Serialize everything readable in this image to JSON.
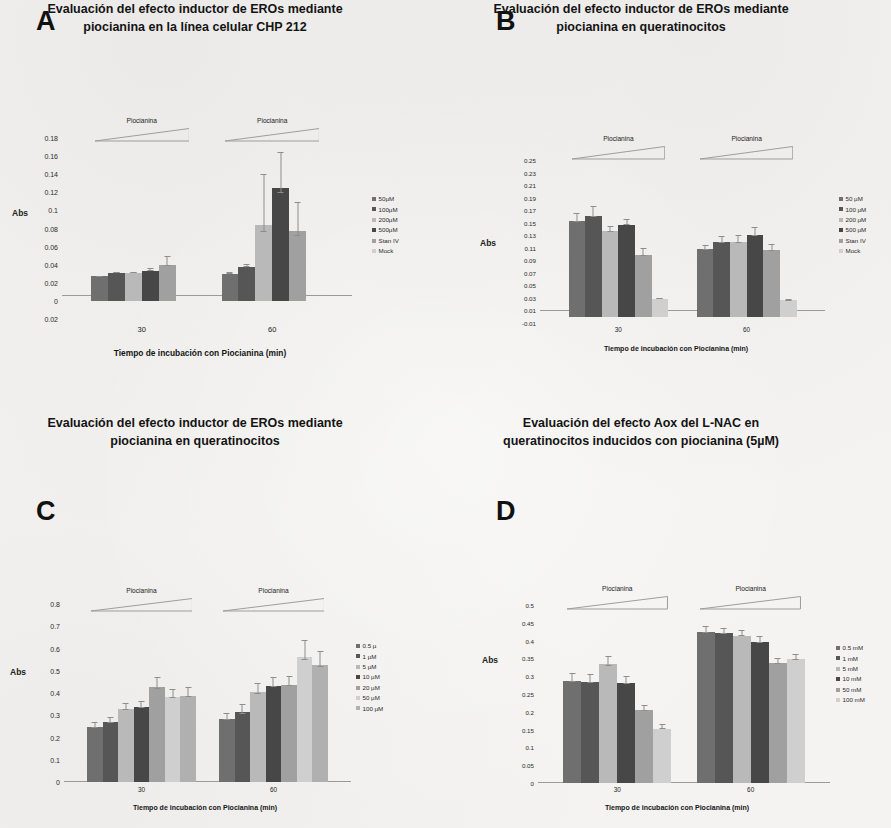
{
  "figure": {
    "panels": [
      "A",
      "B",
      "C",
      "D"
    ]
  },
  "palette": {
    "s1": "#6f6f6f",
    "s2": "#565656",
    "s3": "#b9b9b9",
    "s4": "#474747",
    "s5": "#a0a0a0",
    "s6": "#cfcfcf",
    "s7": "#b0b0b0",
    "axis": "#9a9a9a",
    "text": "#1b1b1b",
    "error_bar": "#8d8d8d"
  },
  "panelA": {
    "letter": "A",
    "title_line1": "Evaluación del efecto inductor de EROs mediante",
    "title_line2": "piocianina en la línea celular CHP 212",
    "wedge_label": "Piocianina",
    "chart_data": {
      "type": "bar",
      "title": "Evaluación del efecto inductor de EROs mediante piocianina en la línea celular CHP 212",
      "xlabel": "Tiempo de incubación con Piocianina (min)",
      "ylabel": "Abs",
      "categories": [
        "30",
        "60"
      ],
      "ylim": [
        -0.02,
        0.18
      ],
      "yticks": [
        "0.18",
        "0.16",
        "0.14",
        "0.12",
        "0.1",
        "0.08",
        "0.06",
        "0.04",
        "0.02",
        "0",
        "0.02"
      ],
      "ytick_values": [
        0.18,
        0.16,
        0.14,
        0.12,
        0.1,
        0.08,
        0.06,
        0.04,
        0.02,
        0,
        -0.02
      ],
      "grid": false,
      "legend_position": "right",
      "series": [
        {
          "name": "50µM",
          "values": [
            0.027,
            0.03
          ],
          "errors": [
            0.001,
            0.002
          ]
        },
        {
          "name": "100µM",
          "values": [
            0.031,
            0.038
          ],
          "errors": [
            0.001,
            0.003
          ]
        },
        {
          "name": "200µM",
          "values": [
            0.031,
            0.084
          ],
          "errors": [
            0.001,
            0.056
          ]
        },
        {
          "name": "500µM",
          "values": [
            0.033,
            0.125
          ],
          "errors": [
            0.003,
            0.04
          ]
        },
        {
          "name": "Stan IV",
          "values": [
            0.04,
            0.077
          ],
          "errors": [
            0.01,
            0.032
          ]
        },
        {
          "name": "Mock",
          "values": [
            0.0,
            0.0
          ],
          "errors": [
            0.0,
            0.0
          ]
        }
      ]
    }
  },
  "panelB": {
    "letter": "B",
    "title_line1": "Evaluación del efecto inductor de EROs mediante",
    "title_line2": "piocianina en queratinocitos",
    "wedge_label": "Piocianina",
    "chart_data": {
      "type": "bar",
      "title": "Evaluación del efecto inductor de EROs mediante piocianina en queratinocitos",
      "xlabel": "Tiempo de incubación con Piocianina (min)",
      "ylabel": "Abs",
      "categories": [
        "30",
        "60"
      ],
      "ylim": [
        -0.01,
        0.25
      ],
      "yticks": [
        "0.25",
        "0.23",
        "0.21",
        "0.19",
        "0.17",
        "0.15",
        "0.13",
        "0.11",
        "0.09",
        "0.07",
        "0.05",
        "0.03",
        "0.01",
        "-0.01"
      ],
      "ytick_values": [
        0.25,
        0.23,
        0.21,
        0.19,
        0.17,
        0.15,
        0.13,
        0.11,
        0.09,
        0.07,
        0.05,
        0.03,
        0.01,
        -0.01
      ],
      "grid": false,
      "legend_position": "right",
      "series": [
        {
          "name": "50 µM",
          "values": [
            0.153,
            0.108
          ],
          "errors": [
            0.013,
            0.006
          ]
        },
        {
          "name": "100 µM",
          "values": [
            0.161,
            0.119
          ],
          "errors": [
            0.016,
            0.01
          ]
        },
        {
          "name": "200 µM",
          "values": [
            0.136,
            0.119
          ],
          "errors": [
            0.008,
            0.011
          ]
        },
        {
          "name": "500 µM",
          "values": [
            0.147,
            0.131
          ],
          "errors": [
            0.009,
            0.012
          ]
        },
        {
          "name": "Stan IV",
          "values": [
            0.098,
            0.106
          ],
          "errors": [
            0.012,
            0.01
          ]
        },
        {
          "name": "Mock",
          "values": [
            0.028,
            0.026
          ],
          "errors": [
            0.002,
            0.002
          ]
        }
      ]
    }
  },
  "panelC": {
    "letter": "C",
    "title_line1": "Evaluación del efecto inductor de EROs mediante",
    "title_line2": "piocianina en queratinocitos",
    "wedge_label": "Piocianina",
    "chart_data": {
      "type": "bar",
      "title": "Evaluación del efecto inductor de EROs mediante piocianina en queratinocitos",
      "xlabel": "Tiempo de incubación  con Piocianina (min)",
      "ylabel": "Abs",
      "categories": [
        "30",
        "60"
      ],
      "ylim": [
        0,
        0.8
      ],
      "yticks": [
        "0.8",
        "0.7",
        "0.6",
        "0.5",
        "0.4",
        "0.3",
        "0.2",
        "0.1",
        "0"
      ],
      "ytick_values": [
        0.8,
        0.7,
        0.6,
        0.5,
        0.4,
        0.3,
        0.2,
        0.1,
        0
      ],
      "grid": false,
      "legend_position": "right",
      "series": [
        {
          "name": "0.5 µ",
          "values": [
            0.248,
            0.282
          ],
          "errors": [
            0.022,
            0.03
          ]
        },
        {
          "name": "1 µM",
          "values": [
            0.268,
            0.313
          ],
          "errors": [
            0.024,
            0.036
          ]
        },
        {
          "name": "5 µM",
          "values": [
            0.327,
            0.404
          ],
          "errors": [
            0.03,
            0.042
          ]
        },
        {
          "name": "10 µM",
          "values": [
            0.337,
            0.432
          ],
          "errors": [
            0.029,
            0.038
          ]
        },
        {
          "name": "20 µM",
          "values": [
            0.425,
            0.436
          ],
          "errors": [
            0.046,
            0.04
          ]
        },
        {
          "name": "50 µM",
          "values": [
            0.383,
            0.562
          ],
          "errors": [
            0.036,
            0.078
          ]
        },
        {
          "name": "100 µM",
          "values": [
            0.387,
            0.528
          ],
          "errors": [
            0.04,
            0.06
          ]
        }
      ]
    }
  },
  "panelD": {
    "letter": "D",
    "title_line1": "Evaluación del efecto Aox del L-NAC en",
    "title_line2": "queratinocitos inducidos  con piocianina (5µM)",
    "wedge_label": "Piocianina",
    "chart_data": {
      "type": "bar",
      "title": "Evaluación del efecto Aox del L-NAC en queratinocitos inducidos con piocianina (5µM)",
      "xlabel": "Tiempo de incubación  con Piocianina (min)",
      "ylabel": "Abs",
      "categories": [
        "30",
        "60"
      ],
      "ylim": [
        0,
        0.5
      ],
      "yticks": [
        "0.5",
        "0.45",
        "0.4",
        "0.35",
        "0.3",
        "0.25",
        "0.2",
        "0.15",
        "0.1",
        "0.05",
        "0"
      ],
      "ytick_values": [
        0.5,
        0.45,
        0.4,
        0.35,
        0.3,
        0.25,
        0.2,
        0.15,
        0.1,
        0.05,
        0
      ],
      "grid": false,
      "legend_position": "right",
      "series": [
        {
          "name": "0.5 mM",
          "values": [
            0.287,
            0.424
          ],
          "errors": [
            0.022,
            0.016
          ]
        },
        {
          "name": "1 mM",
          "values": [
            0.285,
            0.42
          ],
          "errors": [
            0.021,
            0.015
          ]
        },
        {
          "name": "5 mM",
          "values": [
            0.333,
            0.414
          ],
          "errors": [
            0.024,
            0.016
          ]
        },
        {
          "name": "10 mM",
          "values": [
            0.282,
            0.396
          ],
          "errors": [
            0.02,
            0.016
          ]
        },
        {
          "name": "50 mM",
          "values": [
            0.205,
            0.337
          ],
          "errors": [
            0.014,
            0.013
          ]
        },
        {
          "name": "100 mM",
          "values": [
            0.153,
            0.347
          ],
          "errors": [
            0.012,
            0.015
          ]
        }
      ]
    }
  }
}
